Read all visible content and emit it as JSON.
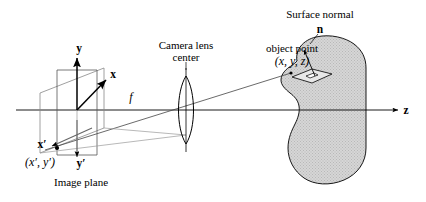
{
  "figure": {
    "background_color": "#ffffff",
    "line_color": "#000000",
    "object_fill_color": "#cccccc",
    "object_stroke_color": "#000000"
  },
  "labels": {
    "axis_y": "y",
    "axis_x": "x",
    "axis_z": "z",
    "axis_x_prime": "x′",
    "axis_y_prime": "y′",
    "image_point": "(x′, y′)",
    "image_plane": "Image plane",
    "focal_length": "f",
    "camera_lens_line1": "Camera lens",
    "camera_lens_line2": "center",
    "surface_normal": "Surface normal",
    "normal_symbol": "n",
    "object_point_line1": "object point",
    "object_point_line2": "(x, y, z)"
  },
  "geometry": {
    "optical_axis_y": 110,
    "origin": {
      "x": 77,
      "y": 110
    },
    "lens_center": {
      "x": 186,
      "y": 110
    },
    "object_point": {
      "x": 291,
      "y": 73
    },
    "image_point": {
      "x": 57,
      "y": 148
    },
    "z_arrow_tip": {
      "x": 400,
      "y": 110
    }
  }
}
